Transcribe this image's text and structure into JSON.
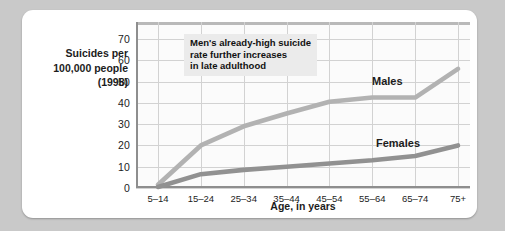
{
  "figure": {
    "background_color": "#c9c9c9",
    "card_color": "#ffffff"
  },
  "chart_data": {
    "type": "line",
    "title": "",
    "xlabel": "Age, in years",
    "ylabel": "Suicides per\n100,000 people\n(1998)",
    "ylabel_lines": [
      "Suicides per",
      "100,000 people",
      "(1998)"
    ],
    "categories": [
      "5–14",
      "15–24",
      "25–34",
      "35–44",
      "45–54",
      "55–64",
      "65–74",
      "75+"
    ],
    "yticks": [
      0,
      10,
      20,
      30,
      40,
      50,
      60,
      70
    ],
    "ylim": [
      0,
      78
    ],
    "grid": true,
    "legend_position": "inline-labels",
    "series": [
      {
        "name": "Males",
        "color": "#b2b2b2",
        "values": [
          1.5,
          20,
          29,
          35,
          40.5,
          42.5,
          42.5,
          56
        ]
      },
      {
        "name": "Females",
        "color": "#919191",
        "values": [
          0.5,
          6.5,
          8.5,
          10,
          11.5,
          13,
          15,
          20
        ]
      }
    ],
    "annotations": [
      {
        "text": "Men's already-high suicide\nrate further increases\nin late adulthood",
        "background": "#ebebeb"
      }
    ]
  },
  "series_labels": {
    "males": "Males",
    "females": "Females"
  }
}
